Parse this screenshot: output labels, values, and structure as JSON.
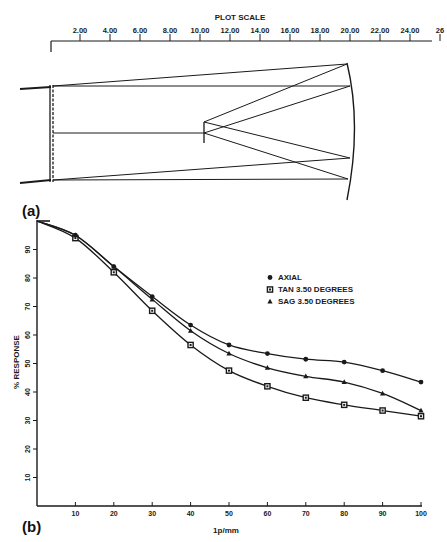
{
  "figure": {
    "panel_a_label": "(a)",
    "panel_b_label": "(b)"
  },
  "scale_bar": {
    "title": "PLOT SCALE",
    "ticks": [
      "2.00",
      "4.00",
      "6.00",
      "8.00",
      "10.00",
      "12.00",
      "14.00",
      "16.00",
      "18.00",
      "20.00",
      "22.00",
      "24.00",
      "26"
    ]
  },
  "diagram": {
    "type": "optical ray trace",
    "elements": [
      "corrector plate",
      "secondary mirror",
      "spherical primary mirror"
    ]
  },
  "chart_data": {
    "type": "line",
    "title": "",
    "xlabel": "1p/mm",
    "ylabel": "% RESPONSE",
    "x": [
      0,
      10,
      20,
      30,
      40,
      50,
      60,
      70,
      80,
      90,
      100
    ],
    "x_ticks": [
      "10",
      "20",
      "30",
      "40",
      "50",
      "60",
      "70",
      "80",
      "90",
      "100"
    ],
    "y_ticks": [
      "10",
      "20",
      "30",
      "40",
      "50",
      "60",
      "70",
      "80",
      "90"
    ],
    "xlim": [
      0,
      100
    ],
    "ylim": [
      0,
      100
    ],
    "grid": false,
    "legend_position": "upper right (inside)",
    "series": [
      {
        "name": "AXIAL",
        "marker": "circle",
        "values": [
          100,
          95,
          84,
          73.5,
          63.5,
          56.5,
          53.5,
          51.5,
          50.5,
          47.5,
          43.5
        ]
      },
      {
        "name": "TAN 3.50 DEGREES",
        "marker": "square",
        "values": [
          100,
          94,
          82,
          68.5,
          56.5,
          47.5,
          42,
          38,
          35.5,
          33.5,
          31.5
        ]
      },
      {
        "name": "SAG 3.50 DEGREES",
        "marker": "triangle",
        "values": [
          100,
          95,
          84,
          72.5,
          61.5,
          53.5,
          48.5,
          45.5,
          43.5,
          39.5,
          33.5
        ]
      }
    ]
  }
}
